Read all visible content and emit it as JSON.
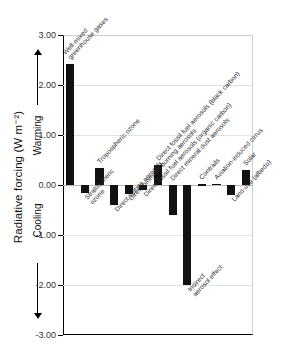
{
  "chart_data": {
    "type": "bar",
    "title": "",
    "subtitle": "",
    "xlabel": "",
    "ylabel": "Radiative forcing (W m⁻²)",
    "ylim": [
      -3.0,
      3.0
    ],
    "ytick_values": [
      3.0,
      2.0,
      1.0,
      0.0,
      -1.0,
      -2.0,
      -3.0
    ],
    "ytick_labels": [
      "3.00",
      "2.00",
      "1.00",
      "0.00",
      "-1.00",
      "-2.00",
      "-3.00"
    ],
    "grid": true,
    "legend": "none",
    "bar_color": "#111111",
    "axis_direction_labels": [
      {
        "text": "Warming",
        "direction": "up"
      },
      {
        "text": "Cooling",
        "direction": "down"
      }
    ],
    "categories": [
      "Well-mixed greenhouse gases",
      "Stratospheric ozone",
      "Tropospheric ozone",
      "Direct sulfate aerosols",
      "Direct biomass burning aerosols",
      "Direct fossil fuel aerosols (organic carbon)",
      "Direct fossil fuel aerosols (black carbon)",
      "Direct mineral dust aerosols",
      "Indirect aerosol effect",
      "Contrails",
      "Aviation-induced cirrus",
      "Land-use (albedo)",
      "Solar"
    ],
    "values": [
      2.42,
      -0.15,
      0.35,
      -0.4,
      -0.17,
      -0.1,
      0.4,
      -0.6,
      -2.0,
      0.02,
      0.03,
      -0.2,
      0.3
    ],
    "bars": [
      {
        "label": "Well-mixed greenhouse gases",
        "label_lines": [
          "Well-mixed",
          "greenhouse gases"
        ],
        "value": 2.42,
        "label_side": "above"
      },
      {
        "label": "Stratospheric ozone",
        "label_lines": [
          "Stratospheric",
          "ozone"
        ],
        "value": -0.15,
        "label_side": "below"
      },
      {
        "label": "Tropospheric ozone",
        "label_lines": [
          "Tropospheric ozone"
        ],
        "value": 0.35,
        "label_side": "above"
      },
      {
        "label": "Direct sulfate aerosols",
        "label_lines": [
          "Direct sulfate aerosols"
        ],
        "value": -0.4,
        "label_side": "below"
      },
      {
        "label": "Direct biomass burning aerosols",
        "label_lines": [
          "Direct biomass burning aerosols"
        ],
        "value": -0.17,
        "label_side": "below"
      },
      {
        "label": "Direct fossil fuel aerosols (organic carbon)",
        "label_lines": [
          "Direct fossil fuel aerosols (organic carbon)"
        ],
        "value": -0.1,
        "label_side": "below"
      },
      {
        "label": "Direct fossil fuel aerosols (black carbon)",
        "label_lines": [
          "Direct fossil fuel aerosols (black carbon)"
        ],
        "value": 0.4,
        "label_side": "above"
      },
      {
        "label": "Direct mineral dust aerosols",
        "label_lines": [
          "Direct mineral dust aerosols"
        ],
        "value": -0.6,
        "label_side": "above"
      },
      {
        "label": "Indirect aerosol effect",
        "label_lines": [
          "Indirect",
          "aerosol effect"
        ],
        "value": -2.0,
        "label_side": "below"
      },
      {
        "label": "Contrails",
        "label_lines": [
          "Contrails"
        ],
        "value": 0.02,
        "label_side": "above"
      },
      {
        "label": "Aviation-induced cirrus",
        "label_lines": [
          "Aviation-induced cirrus"
        ],
        "value": 0.03,
        "label_side": "above"
      },
      {
        "label": "Land-use (albedo)",
        "label_lines": [
          "Land-use (albedo)"
        ],
        "value": -0.2,
        "label_side": "below"
      },
      {
        "label": "Solar",
        "label_lines": [
          "Solar"
        ],
        "value": 0.3,
        "label_side": "above"
      }
    ]
  }
}
